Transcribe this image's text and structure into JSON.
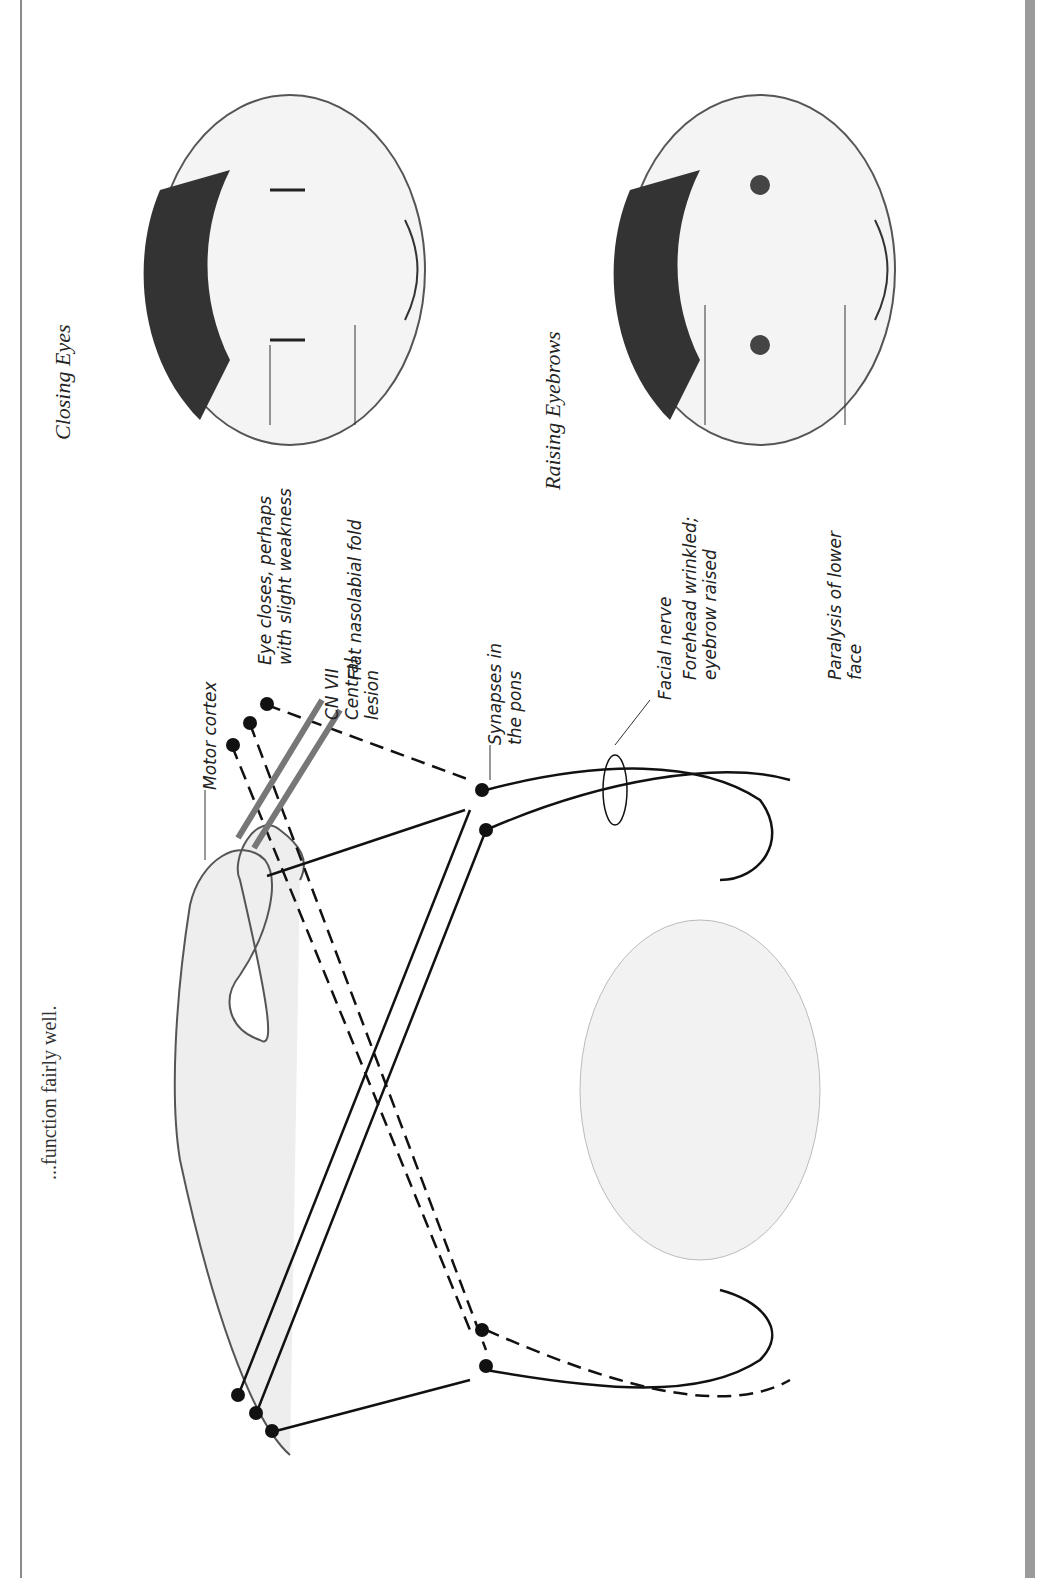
{
  "page": {
    "clipped_top_text": "...function fairly well.",
    "clipped_top_text_note": "partially cut off at page edge"
  },
  "diagram": {
    "labels": {
      "motor_cortex": "Motor cortex",
      "lesion_line1": "CN VII",
      "lesion_line2": "Central",
      "lesion_line3": "lesion",
      "synapses_line1": "Synapses in",
      "synapses_line2": "the pons",
      "facial_nerve": "Facial nerve"
    }
  },
  "faces": {
    "closing_eyes": {
      "caption": "Closing Eyes",
      "annotations": [
        {
          "line1": "Eye closes, perhaps",
          "line2": "with slight weakness"
        },
        {
          "line1": "Flat nasolabial fold",
          "line2": ""
        }
      ]
    },
    "raising_eyebrows": {
      "caption": "Raising Eyebrows",
      "annotations": [
        {
          "line1": "Forehead wrinkled;",
          "line2": "eyebrow raised"
        },
        {
          "line1": "Paralysis of lower",
          "line2": "face"
        }
      ]
    }
  },
  "colors": {
    "ink": "#111111",
    "lesion_bar": "#777777",
    "border": "#8a8a8a",
    "right_band": "#9a9a9a"
  }
}
